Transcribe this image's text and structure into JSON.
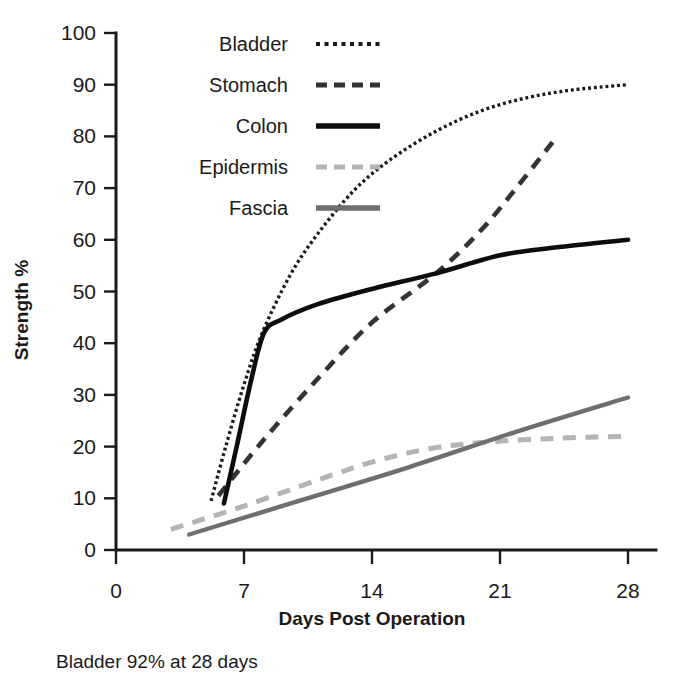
{
  "chart_data": {
    "type": "line",
    "title": "",
    "xlabel": "Days Post Operation",
    "ylabel": "Strength %",
    "xlim": [
      0,
      28
    ],
    "ylim": [
      0,
      100
    ],
    "xticks": [
      0,
      7,
      14,
      21,
      28
    ],
    "yticks": [
      0,
      10,
      20,
      30,
      40,
      50,
      60,
      70,
      80,
      90,
      100
    ],
    "grid": false,
    "legend_position": "top-left-inside",
    "annotation": "Bladder 92% at 28 days",
    "series": [
      {
        "name": "Bladder",
        "style": "dotted",
        "color": "#1a1a1a",
        "width": 3.4,
        "x": [
          5.2,
          6.0,
          7.0,
          8.0,
          9.5,
          11.0,
          13.0,
          15.0,
          17.5,
          20.0,
          22.5,
          25.0,
          28.0
        ],
        "y": [
          9.5,
          20.0,
          32.0,
          42.0,
          53.0,
          61.0,
          69.5,
          75.5,
          81.0,
          85.0,
          87.5,
          89.0,
          90.0
        ]
      },
      {
        "name": "Stomach",
        "style": "dashed",
        "color": "#333333",
        "width": 4.6,
        "x": [
          5.6,
          8.0,
          11.0,
          14.0,
          17.5,
          20.0,
          22.0,
          23.9
        ],
        "y": [
          10.5,
          21.0,
          33.0,
          44.0,
          53.5,
          62.0,
          70.5,
          79.0
        ]
      },
      {
        "name": "Colon",
        "style": "solid",
        "color": "#0d0d0d",
        "width": 4.6,
        "x": [
          5.9,
          6.6,
          7.4,
          8.1,
          9.0,
          11.0,
          14.0,
          17.5,
          21.0,
          24.0,
          28.0
        ],
        "y": [
          9.0,
          20.0,
          33.0,
          42.0,
          44.5,
          47.5,
          50.5,
          53.5,
          57.0,
          58.5,
          60.0
        ]
      },
      {
        "name": "Epidermis",
        "style": "dashed",
        "color": "#b4b4b4",
        "width": 5.0,
        "x": [
          3.0,
          7.0,
          11.0,
          14.0,
          17.0,
          20.0,
          24.0,
          28.0
        ],
        "y": [
          4.0,
          8.5,
          13.5,
          17.0,
          19.5,
          20.8,
          21.6,
          22.0
        ]
      },
      {
        "name": "Fascia",
        "style": "solid",
        "color": "#6e6e6e",
        "width": 4.4,
        "x": [
          4.0,
          10.0,
          16.0,
          22.0,
          28.0
        ],
        "y": [
          3.0,
          9.5,
          16.0,
          23.0,
          29.5
        ]
      }
    ]
  },
  "axes": {
    "y_title": "Strength %",
    "x_title": "Days Post Operation",
    "x_tick_labels": [
      "0",
      "7",
      "14",
      "21",
      "28"
    ],
    "y_tick_labels": [
      "0",
      "10",
      "20",
      "30",
      "40",
      "50",
      "60",
      "70",
      "80",
      "90",
      "100"
    ]
  },
  "legend": {
    "items": [
      {
        "label": "Bladder",
        "style": "dotted",
        "color": "#1a1a1a"
      },
      {
        "label": "Stomach",
        "style": "dashed",
        "color": "#333333"
      },
      {
        "label": "Colon",
        "style": "solid",
        "color": "#0d0d0d"
      },
      {
        "label": "Epidermis",
        "style": "dashed",
        "color": "#b4b4b4"
      },
      {
        "label": "Fascia",
        "style": "solid",
        "color": "#6e6e6e"
      }
    ]
  },
  "caption": {
    "text": "Bladder 92% at 28 days"
  },
  "colors": {
    "ink": "#1a1a1a",
    "light_gray": "#b4b4b4",
    "mid_gray": "#6e6e6e",
    "background": "#ffffff"
  }
}
